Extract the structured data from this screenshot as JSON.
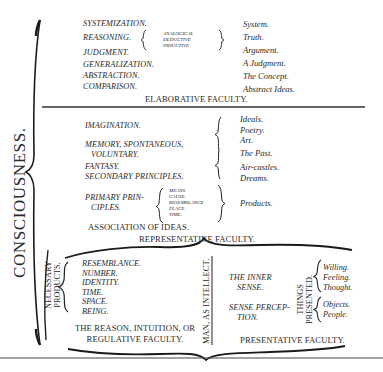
{
  "title": "CONSCIOUSNESS.",
  "elaborative": {
    "faculties": [
      "SYSTEMIZATION.",
      "REASONING.",
      "JUDGMENT.",
      "GENERALIZATION.",
      "ABSTRACTION.",
      "COMPARISON."
    ],
    "reasoning_kinds": [
      "ANALOGICAL",
      "DEDUCTIVE",
      "INDUCTIVE"
    ],
    "results": [
      "System.",
      "Truth.",
      "Argument.",
      "A Judgment.",
      "The Concept.",
      "Abstract Ideas."
    ],
    "label": "ELABORATIVE FACULTY."
  },
  "representative": {
    "imagination": "IMAGINATION.",
    "memory_1": "MEMORY, SPONTANEOUS,",
    "memory_2": "VOLUNTARY.",
    "fantasy": "FANTASY.",
    "secondary": "SECONDARY PRINCIPLES.",
    "primary_1": "PRIMARY PRIN-",
    "primary_2": "CIPLES.",
    "primary_kinds": [
      "MEANS.",
      "CAUSE.",
      "RESEMBLANCE",
      "PLACE.",
      "TIME."
    ],
    "results": [
      "Ideals.",
      "Poetry.",
      "Art.",
      "The Past.",
      "Air-castles.",
      "Dreams.",
      "Products."
    ],
    "association": "ASSOCIATION OF IDEAS.",
    "label": "REPRESENTATIVE FACULTY."
  },
  "regulative": {
    "side_label_1": "NECESSARY",
    "side_label_2": "PRODUCTS.",
    "products": [
      "RESEMBLANCE.",
      "NUMBER.",
      "IDENTITY.",
      "TIME.",
      "SPACE.",
      "BEING."
    ],
    "label_1": "THE REASON, INTUITION, OR",
    "label_2": "REGULATIVE FACULTY."
  },
  "divider_label": "MAN, AS INTELLECT.",
  "presentative": {
    "inner_1": "THE INNER",
    "inner_2": "SENSE.",
    "sense_1": "SENSE PERCEP-",
    "sense_2": "TION.",
    "things_1": "THINGS",
    "things_2": "PRESENTED.",
    "inner_things": [
      "Willing.",
      "Feeling.",
      "Thought."
    ],
    "outer_things": [
      "Objects.",
      "People."
    ],
    "label": "PRESENTATIVE FACULTY."
  }
}
